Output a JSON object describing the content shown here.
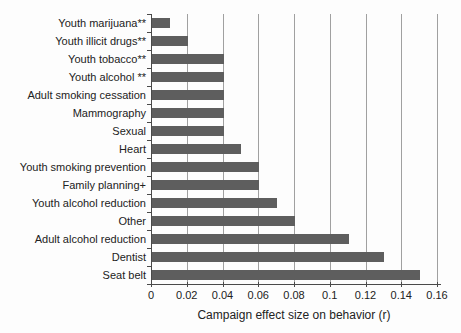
{
  "figure": {
    "xlabel": "Campaign effect size on behavior (r)"
  },
  "chart_data": {
    "type": "bar",
    "orientation": "horizontal",
    "title": "",
    "xlabel": "Campaign effect size on behavior (r)",
    "ylabel": "",
    "categories": [
      "Youth marijuana**",
      "Youth illicit drugs**",
      "Youth tobacco**",
      "Youth alcohol **",
      "Adult smoking cessation",
      "Mammography",
      "Sexual",
      "Heart",
      "Youth smoking prevention",
      "Family planning+",
      "Youth alcohol reduction",
      "Other",
      "Adult alcohol reduction",
      "Dentist",
      "Seat belt"
    ],
    "values": [
      0.01,
      0.02,
      0.04,
      0.04,
      0.04,
      0.04,
      0.04,
      0.05,
      0.06,
      0.06,
      0.07,
      0.08,
      0.11,
      0.13,
      0.15
    ],
    "xlim": [
      0,
      0.16
    ],
    "xticks": [
      0,
      0.02,
      0.04,
      0.06,
      0.08,
      0.1,
      0.12,
      0.14,
      0.16
    ],
    "xtick_labels": [
      "0",
      "0.02",
      "0.04",
      "0.06",
      "0.08",
      "0.1",
      "0.12",
      "0.14",
      "0.16"
    ],
    "grid": true,
    "legend": "none",
    "bar_color": "#5e5e5e",
    "gridline_color": "#a0a0a0",
    "axis_color": "#4a4a4a",
    "background_color": "#fdfdfd"
  }
}
